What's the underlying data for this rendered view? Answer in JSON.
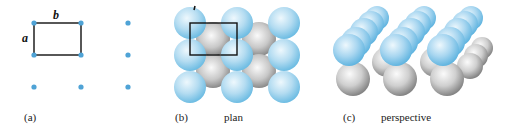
{
  "figure": {
    "panels": [
      {
        "id": "a",
        "label": "(a)",
        "title": "",
        "description": "2D rectangular lattice with unit cell",
        "lattice_points": [
          [
            34,
            23
          ],
          [
            81,
            23
          ],
          [
            128,
            23
          ],
          [
            34,
            55
          ],
          [
            81,
            55
          ],
          [
            128,
            55
          ],
          [
            34,
            87
          ],
          [
            81,
            87
          ],
          [
            128,
            87
          ]
        ],
        "unit_cell": {
          "x": 34,
          "y": 23,
          "width": 47,
          "height": 32
        },
        "edge_labels": {
          "horizontal": "b",
          "vertical": "a"
        }
      },
      {
        "id": "b",
        "label": "(b)",
        "title": "plan",
        "description": "Plan view of sphere layers: blue top layer, grey lower layer",
        "blue_spheres": [
          [
            186,
            23
          ],
          [
            233,
            23
          ],
          [
            280,
            23
          ],
          [
            186,
            55
          ],
          [
            233,
            55
          ],
          [
            280,
            55
          ],
          [
            186,
            87
          ],
          [
            233,
            87
          ],
          [
            280,
            87
          ]
        ],
        "grey_spheres": [
          [
            210,
            39
          ],
          [
            256,
            39
          ],
          [
            210,
            71
          ],
          [
            256,
            71
          ]
        ],
        "unit_cell": {
          "x": 190,
          "y": 23,
          "width": 47,
          "height": 32
        }
      },
      {
        "id": "c",
        "label": "(c)",
        "title": "perspective",
        "description": "Perspective view of rows of blue spheres atop a grey layer"
      }
    ],
    "colors": {
      "lattice_point": "#4fa3d6",
      "unit_cell_line": "#111111",
      "blue_sphere_light": "#e3f3fb",
      "blue_sphere_mid": "#a9d8f0",
      "blue_sphere_dark": "#6fbde3",
      "grey_sphere_light": "#f4f4f4",
      "grey_sphere_mid": "#c6c6c6",
      "grey_sphere_dark": "#8a8a8a"
    }
  }
}
